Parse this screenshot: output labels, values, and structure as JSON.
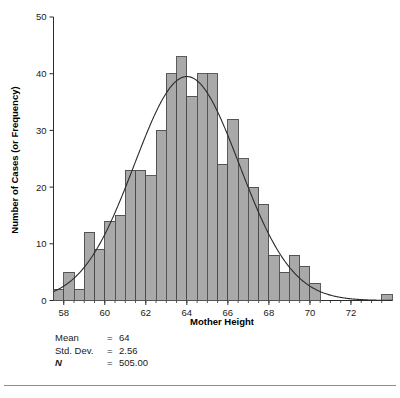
{
  "chart_data": {
    "type": "bar",
    "title": "",
    "xlabel": "Mother Height",
    "ylabel": "Number of Cases (or Frequency)",
    "xlim": [
      57.5,
      74.0
    ],
    "ylim": [
      0,
      50
    ],
    "grid": false,
    "legend": "none",
    "bin_width": 0.5,
    "bar_color": "#a9a9a9",
    "bar_edge_color": "#4a4a4a",
    "curve_color": "#2b2b2b",
    "xticks": [
      58,
      60,
      62,
      64,
      66,
      68,
      70,
      72
    ],
    "xtick_labels": [
      "58",
      "60",
      "62",
      "64",
      "66",
      "68",
      "70",
      "72"
    ],
    "yticks": [
      0,
      10,
      20,
      30,
      40,
      50
    ],
    "ytick_labels": [
      "0",
      "10",
      "20",
      "30",
      "40",
      "50"
    ],
    "minor_xtick_step": 0.5,
    "bin_centers": [
      57.75,
      58.25,
      58.75,
      59.25,
      59.75,
      60.25,
      60.75,
      61.25,
      61.75,
      62.25,
      62.75,
      63.25,
      63.75,
      64.25,
      64.75,
      65.25,
      65.75,
      66.25,
      66.75,
      67.25,
      67.75,
      68.25,
      68.75,
      69.25,
      69.75,
      70.25,
      73.75
    ],
    "values": [
      2,
      5,
      2,
      12,
      9,
      14,
      15,
      23,
      23,
      22,
      30,
      40,
      43,
      36,
      40,
      40,
      24,
      32,
      25,
      20,
      17,
      8,
      5,
      8,
      6,
      3,
      1
    ],
    "overlay_curve": {
      "type": "normal",
      "mean": 64,
      "std": 2.56,
      "n": 505,
      "peak_value": 39.5
    },
    "annotations": [
      {
        "label": "Mean",
        "eq": "=",
        "value": "64"
      },
      {
        "label": "Std. Dev.",
        "eq": "=",
        "value": "2.56"
      },
      {
        "label": "N",
        "eq": "=",
        "value": "505.00"
      }
    ]
  },
  "stats": {
    "mean_label": "Mean",
    "mean_eq": "=",
    "mean_value": "64",
    "sd_label": "Std. Dev.",
    "sd_eq": "=",
    "sd_value": "2.56",
    "n_label": "N",
    "n_eq": "=",
    "n_value": "505.00"
  }
}
